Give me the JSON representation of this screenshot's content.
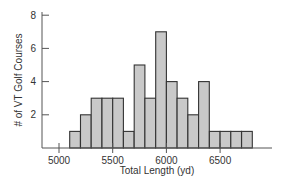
{
  "chart_data": {
    "type": "bar",
    "subtype": "histogram",
    "title": "",
    "xlabel": "Total Length (yd)",
    "ylabel": "# of VT Golf Courses",
    "bin_width": 100,
    "bin_edges": [
      5100,
      5200,
      5300,
      5400,
      5500,
      5600,
      5700,
      5800,
      5900,
      6000,
      6100,
      6200,
      6300,
      6400,
      6500,
      6600,
      6700,
      6800
    ],
    "categories": [
      "5100-5200",
      "5200-5300",
      "5300-5400",
      "5400-5500",
      "5500-5600",
      "5600-5700",
      "5700-5800",
      "5800-5900",
      "5900-6000",
      "6000-6100",
      "6100-6200",
      "6200-6300",
      "6300-6400",
      "6400-6500",
      "6500-6600",
      "6600-6700",
      "6700-6800"
    ],
    "values": [
      1,
      2,
      3,
      3,
      3,
      1,
      5,
      3,
      7,
      4,
      3,
      2,
      4,
      1,
      1,
      1,
      1
    ],
    "xlim": [
      4850,
      7000
    ],
    "ylim": [
      0,
      8
    ],
    "x_ticks": [
      5000,
      5500,
      6000,
      6500
    ],
    "x_tick_labels": [
      "5000",
      "5500",
      "6000",
      "6500"
    ],
    "y_ticks": [
      2,
      4,
      6,
      8
    ],
    "y_tick_labels": [
      "2",
      "4",
      "6",
      "8"
    ],
    "grid": false,
    "legend": null,
    "colors": {
      "bar_fill": "#c9c9c9",
      "bar_edge": "#333333",
      "axis": "#555555"
    }
  }
}
